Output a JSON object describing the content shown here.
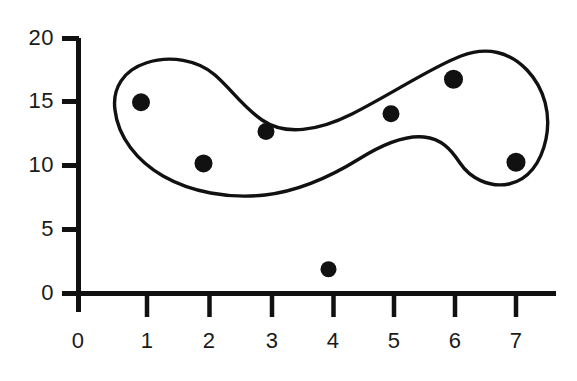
{
  "chart_data": {
    "type": "scatter",
    "title": "",
    "subtitle": "",
    "xlabel": "",
    "ylabel": "",
    "xlim": [
      0,
      7.6
    ],
    "ylim": [
      0,
      20
    ],
    "grid": false,
    "legend": null,
    "x_ticks": [
      "0",
      "1",
      "2",
      "3",
      "4",
      "5",
      "6",
      "7"
    ],
    "y_ticks": [
      "0",
      "5",
      "10",
      "15",
      "20"
    ],
    "x_tick_values": [
      0,
      1,
      2,
      3,
      4,
      5,
      6,
      7
    ],
    "y_tick_values": [
      0,
      5,
      10,
      15,
      20
    ],
    "points": [
      {
        "label": "p1",
        "x": 1,
        "y": 15.0,
        "in_cluster": true
      },
      {
        "label": "p2",
        "x": 2,
        "y": 10.2,
        "in_cluster": true
      },
      {
        "label": "p3",
        "x": 3,
        "y": 12.7,
        "in_cluster": true
      },
      {
        "label": "p4",
        "x": 4,
        "y": 1.9,
        "in_cluster": false
      },
      {
        "label": "p5",
        "x": 5,
        "y": 14.1,
        "in_cluster": true
      },
      {
        "label": "p6",
        "x": 6,
        "y": 16.8,
        "in_cluster": true
      },
      {
        "label": "p7",
        "x": 7,
        "y": 10.3,
        "in_cluster": true
      }
    ],
    "annotations": [
      {
        "name": "cluster-contour",
        "type": "closed-freeform-curve",
        "encloses": [
          "p1",
          "p2",
          "p3",
          "p5",
          "p6",
          "p7"
        ],
        "excludes": [
          "p4"
        ]
      }
    ],
    "marker": {
      "shape": "circle",
      "color": "#111111",
      "size_px": 17
    },
    "colors": {
      "axis": "#111111",
      "marker": "#111111",
      "contour": "#111111",
      "text": "#1a1a1a",
      "background": "#ffffff"
    }
  },
  "axes": {
    "y_tick_labels": [
      {
        "value": "20"
      },
      {
        "value": "15"
      },
      {
        "value": "10"
      },
      {
        "value": "5"
      },
      {
        "value": "0"
      }
    ],
    "x_tick_labels": [
      {
        "value": "0"
      },
      {
        "value": "1"
      },
      {
        "value": "2"
      },
      {
        "value": "3"
      },
      {
        "value": "4"
      },
      {
        "value": "5"
      },
      {
        "value": "6"
      },
      {
        "value": "7"
      }
    ]
  }
}
